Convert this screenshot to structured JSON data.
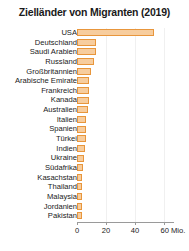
{
  "chart": {
    "title": "Zielländer von Migranten (2019)",
    "axis_unit": "Mio."
  },
  "chart_data": {
    "type": "bar",
    "orientation": "horizontal",
    "title": "Zielländer von Migranten (2019)",
    "xlabel": "Mio.",
    "ylabel": "",
    "xlim": [
      0,
      67
    ],
    "xticks": [
      0,
      20,
      40,
      60
    ],
    "xticklabels": [
      "0",
      "20",
      "40",
      "60 Mio."
    ],
    "grid": true,
    "legend": null,
    "bar_fill_color": "#f7cd9e",
    "bar_border_color": "#e8963c",
    "categories": [
      "USA",
      "Deutschland",
      "Saudi Arabien",
      "Russland",
      "Großbritannien",
      "Arabische Emirate",
      "Frankreich",
      "Kanada",
      "Australien",
      "Italien",
      "Spanien",
      "Türkei",
      "Indien",
      "Ukraine",
      "Südafrika",
      "Kasachstan",
      "Thailand",
      "Malaysia",
      "Jordanien",
      "Pakistan"
    ],
    "values": [
      53.5,
      13.1,
      13.1,
      11.6,
      9.6,
      8.6,
      8.3,
      8.0,
      7.5,
      6.3,
      6.1,
      5.9,
      5.2,
      5.0,
      4.2,
      3.7,
      3.6,
      3.4,
      3.3,
      3.2
    ]
  }
}
